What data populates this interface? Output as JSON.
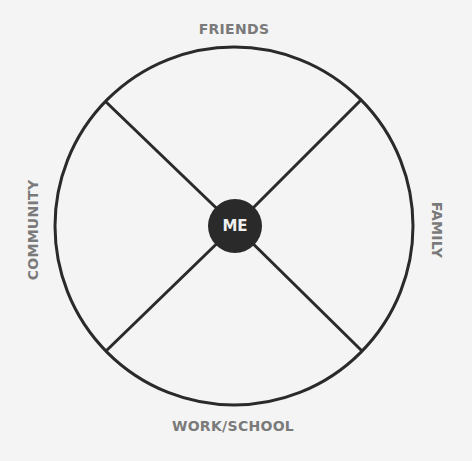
{
  "diagram": {
    "type": "circle-map",
    "center_label": "ME",
    "sections": {
      "top": "FRIENDS",
      "right": "FAMILY",
      "bottom": "WORK/SCHOOL",
      "left": "COMMUNITY"
    },
    "colors": {
      "background": "#f4f4f4",
      "stroke": "#2a2a2a",
      "center_fill": "#2a2a2a",
      "center_text": "#f0f0f0",
      "label_text": "#7a7a7a"
    }
  }
}
